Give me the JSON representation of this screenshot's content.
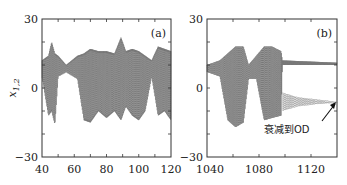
{
  "chart_data": [
    {
      "type": "line",
      "panel_label": "(a)",
      "title": "",
      "xlabel": "",
      "ylabel": "x1,2",
      "xlim": [
        40,
        120
      ],
      "ylim": [
        -30,
        30
      ],
      "x_ticks": [
        "40",
        "60",
        "80",
        "100",
        "120"
      ],
      "y_ticks": [
        "30",
        "0",
        "-30"
      ],
      "grid": false,
      "legend": null,
      "series": [
        {
          "name": "x1 (solid)",
          "style": "solid gray oscillation",
          "envelope": [
            {
              "x": 40,
              "upper": 12,
              "lower": 5
            },
            {
              "x": 44,
              "upper": 14,
              "lower": -12
            },
            {
              "x": 46,
              "upper": 20,
              "lower": -10
            },
            {
              "x": 48,
              "upper": 15,
              "lower": -16
            },
            {
              "x": 50,
              "upper": 14,
              "lower": 5
            },
            {
              "x": 55,
              "upper": 10,
              "lower": 7
            },
            {
              "x": 62,
              "upper": 14,
              "lower": 4
            },
            {
              "x": 66,
              "upper": 15,
              "lower": -14
            },
            {
              "x": 70,
              "upper": 17,
              "lower": -15
            },
            {
              "x": 75,
              "upper": 16,
              "lower": -10
            },
            {
              "x": 80,
              "upper": 16,
              "lower": -13
            },
            {
              "x": 85,
              "upper": 15,
              "lower": -10
            },
            {
              "x": 89,
              "upper": 22,
              "lower": -14
            },
            {
              "x": 92,
              "upper": 16,
              "lower": -8
            },
            {
              "x": 96,
              "upper": 17,
              "lower": -12
            },
            {
              "x": 100,
              "upper": 16,
              "lower": -14
            },
            {
              "x": 104,
              "upper": 14,
              "lower": -10
            },
            {
              "x": 108,
              "upper": 12,
              "lower": 5
            },
            {
              "x": 112,
              "upper": 18,
              "lower": -12
            },
            {
              "x": 116,
              "upper": 17,
              "lower": -10
            },
            {
              "x": 120,
              "upper": 16,
              "lower": -14
            }
          ]
        },
        {
          "name": "x2 (dotted)",
          "style": "dotted gray oscillation",
          "note": "closely overlaps x1 in panel (a)"
        }
      ]
    },
    {
      "type": "line",
      "panel_label": "(b)",
      "title": "",
      "xlabel": "",
      "ylabel": "",
      "xlim": [
        1040,
        1140
      ],
      "ylim": [
        -30,
        30
      ],
      "x_ticks": [
        "1040",
        "1080",
        "1120"
      ],
      "y_ticks": [
        "30",
        "0",
        "-30"
      ],
      "grid": false,
      "legend": null,
      "annotations": [
        {
          "text": "衰减到OD",
          "x": 1088,
          "y": -17,
          "arrow_to": {
            "x": 1139,
            "y": -7
          }
        }
      ],
      "series": [
        {
          "name": "x1 (solid)",
          "style": "solid gray oscillation",
          "envelope": [
            {
              "x": 1040,
              "upper": 10,
              "lower": 7
            },
            {
              "x": 1050,
              "upper": 12,
              "lower": 5
            },
            {
              "x": 1056,
              "upper": 15,
              "lower": -14
            },
            {
              "x": 1062,
              "upper": 18,
              "lower": -17
            },
            {
              "x": 1068,
              "upper": 18,
              "lower": -15
            },
            {
              "x": 1072,
              "upper": 10,
              "lower": 4
            },
            {
              "x": 1078,
              "upper": 14,
              "lower": 4
            },
            {
              "x": 1084,
              "upper": 18,
              "lower": -14
            },
            {
              "x": 1090,
              "upper": 18,
              "lower": -13
            },
            {
              "x": 1097,
              "upper": 16,
              "lower": -12
            },
            {
              "x": 1098,
              "upper": 12,
              "lower": 10
            },
            {
              "x": 1140,
              "upper": 11,
              "lower": 10
            }
          ],
          "final_state": "settles near +10.5"
        },
        {
          "name": "x2 (dotted)",
          "style": "dotted gray oscillation",
          "envelope": [
            {
              "x": 1098,
              "upper": -2,
              "lower": -10
            },
            {
              "x": 1110,
              "upper": -4,
              "lower": -8
            },
            {
              "x": 1125,
              "upper": -5,
              "lower": -7
            },
            {
              "x": 1140,
              "upper": -6,
              "lower": -6.5
            }
          ],
          "final_state": "decays to OD near -6"
        }
      ]
    }
  ],
  "labels": {
    "ylabel": "x",
    "ylabel_sub": "1,2",
    "panel_a": "(a)",
    "panel_b": "(b)",
    "annotation": "衰减到OD",
    "a_x_ticks": [
      "40",
      "60",
      "80",
      "100",
      "120"
    ],
    "b_x_ticks": [
      "1040",
      "1080",
      "1120"
    ],
    "y_top": "30",
    "y_mid": "0",
    "y_bot": "−30"
  },
  "colors": {
    "trace": "#6e6e6e",
    "trace_light": "#9a9a9a",
    "axis": "#333333"
  }
}
